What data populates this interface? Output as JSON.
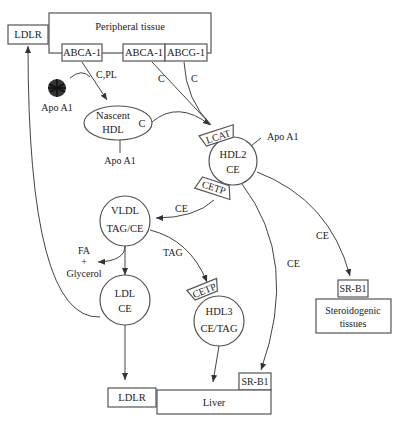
{
  "diagram": {
    "nodes": {
      "peripheral_tissue": "Peripheral tissue",
      "ldlr_top": "LDLR",
      "abca1_left": "ABCA-1",
      "abca1_right": "ABCA-1",
      "abcg1": "ABCG-1",
      "apoa1_free": "Apo A1",
      "nascent_hdl_line1": "Nascent",
      "nascent_hdl_line2": "HDL",
      "nascent_hdl_c": "C",
      "nascent_apoa1": "Apo A1",
      "lcat": "LCAT",
      "hdl2_line1": "HDL2",
      "hdl2_line2": "CE",
      "hdl2_apoa1": "Apo A1",
      "cetp_hdl2": "CETP",
      "vldl_line1": "VLDL",
      "vldl_line2": "TAG/CE",
      "fa": "FA",
      "plus": "+",
      "glycerol": "Glycerol",
      "ldl_line1": "LDL",
      "ldl_line2": "CE",
      "cetp_hdl3": "CETP",
      "hdl3_line1": "HDL3",
      "hdl3_line2": "CE/TAG",
      "srb1_steroid": "SR-B1",
      "steroid_line1": "Steroidogenic",
      "steroid_line2": "tissues",
      "srb1_liver": "SR-B1",
      "ldlr_bottom": "LDLR",
      "liver": "Liver"
    },
    "edge_labels": {
      "c_pl": "C,PL",
      "c_abca1": "C",
      "c_abcg1": "C",
      "ce_to_vldl": "CE",
      "tag_to_hdl3": "TAG",
      "ce_to_liver": "CE",
      "ce_to_steroid": "CE"
    }
  }
}
